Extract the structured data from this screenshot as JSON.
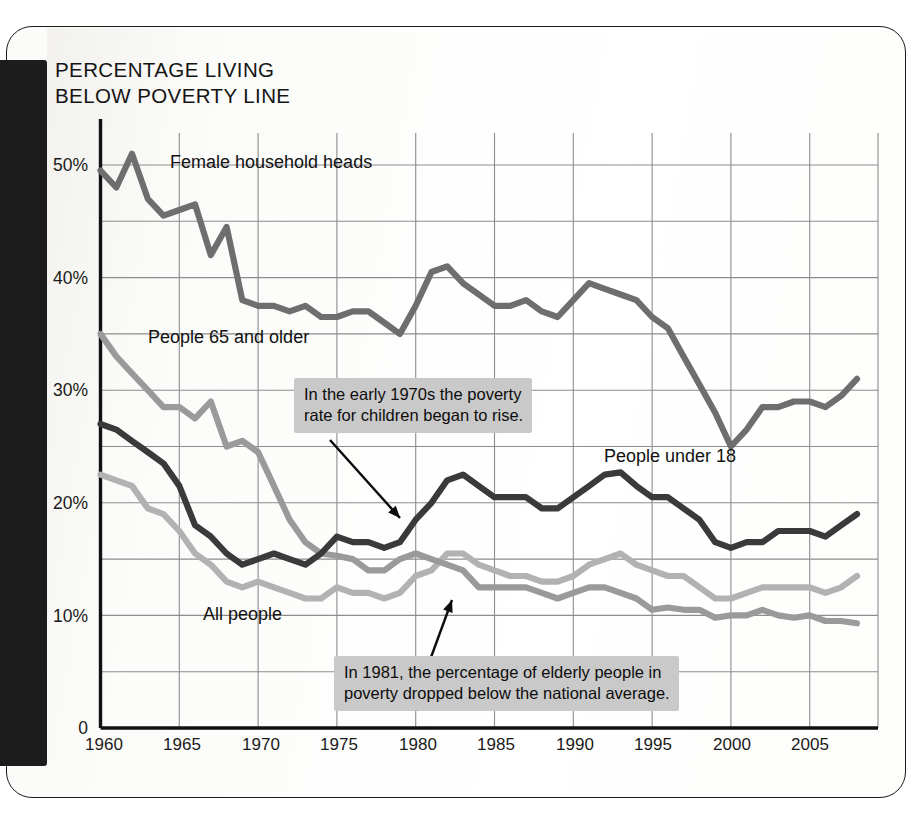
{
  "page": {
    "title": "PERCENTAGE LIVING\nBELOW POVERTY LINE"
  },
  "colors": {
    "under18": "#3a3a3a",
    "female_heads": "#6e6e6e",
    "elderly": "#9a9a9a",
    "all_people": "#b2b2b2",
    "gridline": "#8d8d8d",
    "axis": "#111111",
    "callout_bg": "#c9c9c9",
    "page_background": "#fbfbf9",
    "spine": "#1c1c1c"
  },
  "series_labels": {
    "female_heads": "Female household heads",
    "elderly": "People 65 and older",
    "under18": "People under 18",
    "all_people": "All people"
  },
  "callouts": [
    {
      "id": "children-rise",
      "text": "In the early 1970s the poverty\nrate for children began to rise."
    },
    {
      "id": "elderly-below-average",
      "text": "In 1981, the percentage of elderly people in\npoverty dropped below the national average."
    }
  ],
  "chart_data": {
    "type": "line",
    "title": "PERCENTAGE LIVING BELOW POVERTY LINE",
    "xlabel": "",
    "ylabel": "Percentage living below poverty line",
    "xlim": [
      1960,
      2008
    ],
    "ylim": [
      0,
      52
    ],
    "grid": true,
    "grid_y_minor_step": 5,
    "grid_x_minor_step": 5,
    "legend": "inline-labels",
    "y_ticks": [
      "0",
      "10%",
      "20%",
      "30%",
      "40%",
      "50%"
    ],
    "y_tick_values": [
      0,
      10,
      20,
      30,
      40,
      50
    ],
    "x_ticks": [
      "1960",
      "1965",
      "1970",
      "1975",
      "1980",
      "1985",
      "1990",
      "1995",
      "2000",
      "2005"
    ],
    "x_tick_values": [
      1960,
      1965,
      1970,
      1975,
      1980,
      1985,
      1990,
      1995,
      2000,
      2005
    ],
    "x": [
      1960,
      1961,
      1962,
      1963,
      1964,
      1965,
      1966,
      1967,
      1968,
      1969,
      1970,
      1971,
      1972,
      1973,
      1974,
      1975,
      1976,
      1977,
      1978,
      1979,
      1980,
      1981,
      1982,
      1983,
      1984,
      1985,
      1986,
      1987,
      1988,
      1989,
      1990,
      1991,
      1992,
      1993,
      1994,
      1995,
      1996,
      1997,
      1998,
      1999,
      2000,
      2001,
      2002,
      2003,
      2004,
      2005,
      2006,
      2007,
      2008
    ],
    "series": [
      {
        "name": "Female household heads",
        "color": "#6e6e6e",
        "values": [
          49.5,
          48.0,
          51.0,
          47.0,
          45.5,
          46.0,
          46.5,
          42.0,
          44.5,
          38.0,
          37.5,
          37.5,
          37.0,
          37.5,
          36.5,
          36.5,
          37.0,
          37.0,
          36.0,
          35.0,
          37.5,
          40.5,
          41.0,
          39.5,
          38.5,
          37.5,
          37.5,
          38.0,
          37.0,
          36.5,
          38.0,
          39.5,
          39.0,
          38.5,
          38.0,
          36.5,
          35.5,
          33.0,
          30.5,
          28.0,
          25.0,
          26.5,
          28.5,
          28.5,
          29.0,
          29.0,
          28.5,
          29.5,
          31.0
        ]
      },
      {
        "name": "People 65 and older",
        "color": "#9a9a9a",
        "values": [
          35.0,
          33.0,
          31.5,
          30.0,
          28.5,
          28.5,
          27.5,
          29.0,
          25.0,
          25.5,
          24.5,
          21.5,
          18.5,
          16.5,
          15.5,
          15.3,
          15.0,
          14.0,
          14.0,
          15.0,
          15.5,
          15.0,
          14.5,
          14.0,
          12.5,
          12.5,
          12.5,
          12.5,
          12.0,
          11.5,
          12.0,
          12.5,
          12.5,
          12.0,
          11.5,
          10.5,
          10.7,
          10.5,
          10.5,
          9.8,
          10.0,
          10.0,
          10.5,
          10.0,
          9.8,
          10.0,
          9.5,
          9.5,
          9.3
        ]
      },
      {
        "name": "People under 18",
        "color": "#3a3a3a",
        "values": [
          27.0,
          26.5,
          25.5,
          24.5,
          23.5,
          21.5,
          18.0,
          17.0,
          15.5,
          14.5,
          15.0,
          15.5,
          15.0,
          14.5,
          15.5,
          17.0,
          16.5,
          16.5,
          16.0,
          16.5,
          18.5,
          20.0,
          22.0,
          22.5,
          21.5,
          20.5,
          20.5,
          20.5,
          19.5,
          19.5,
          20.5,
          21.5,
          22.5,
          22.7,
          21.5,
          20.5,
          20.5,
          19.5,
          18.5,
          16.5,
          16.0,
          16.5,
          16.5,
          17.5,
          17.5,
          17.5,
          17.0,
          18.0,
          19.0
        ]
      },
      {
        "name": "All people",
        "color": "#b2b2b2",
        "values": [
          22.5,
          22.0,
          21.5,
          19.5,
          19.0,
          17.5,
          15.5,
          14.5,
          13.0,
          12.5,
          13.0,
          12.5,
          12.0,
          11.5,
          11.5,
          12.5,
          12.0,
          12.0,
          11.5,
          12.0,
          13.5,
          14.0,
          15.5,
          15.5,
          14.5,
          14.0,
          13.5,
          13.5,
          13.0,
          13.0,
          13.5,
          14.5,
          15.0,
          15.5,
          14.5,
          14.0,
          13.5,
          13.5,
          12.5,
          11.5,
          11.5,
          12.0,
          12.5,
          12.5,
          12.5,
          12.5,
          12.0,
          12.5,
          13.5
        ]
      }
    ],
    "annotations": [
      {
        "text": "In the early 1970s the poverty rate for children began to rise.",
        "points_to_year": 1979,
        "points_to_value": 16.3
      },
      {
        "text": "In 1981, the percentage of elderly people in poverty dropped below the national average.",
        "points_to_year": 1981,
        "points_to_value": 14.2
      }
    ]
  }
}
